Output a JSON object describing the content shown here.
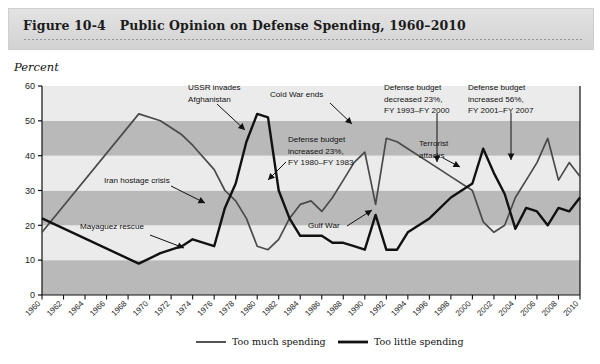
{
  "figure": {
    "number_label": "Figure 10-4",
    "title": "Public Opinion on Defense Spending, 1960–2010"
  },
  "axis": {
    "y_title": "Percent"
  },
  "colors": {
    "band_light": "#ebebeb",
    "band_dark": "#b9b9b9",
    "too_much_line": "#4a4a4a",
    "too_little_line": "#111111",
    "header_bg": "#dcdcdc",
    "axis": "#111111"
  },
  "legend": {
    "items": [
      {
        "label": "Too much spending",
        "key": "too_much"
      },
      {
        "label": "Too little spending",
        "key": "too_little"
      }
    ]
  },
  "annotations": [
    {
      "name": "mayaguez-rescue",
      "text": "Mayaguez rescue",
      "lines": [
        "Mayaguez rescue"
      ],
      "x": 80,
      "y": 229
    },
    {
      "name": "iran-hostage-crisis",
      "text": "Iran hostage crisis",
      "lines": [
        "Iran hostage crisis"
      ],
      "x": 104,
      "y": 183
    },
    {
      "name": "ussr-invades-afghanistan",
      "text": "USSR invades Afghanistan",
      "lines": [
        "USSR invades",
        "Afghanistan"
      ],
      "x": 188,
      "y": 90
    },
    {
      "name": "cold-war-ends",
      "text": "Cold War ends",
      "lines": [
        "Cold War ends"
      ],
      "x": 270,
      "y": 97
    },
    {
      "name": "defense-budget-increased-23",
      "text": "Defense budget increased 23%, FY 1980–FY 1983",
      "lines": [
        "Defense budget",
        "increased 23%,",
        "FY 1980–FY 1983"
      ],
      "x": 288,
      "y": 142
    },
    {
      "name": "gulf-war",
      "text": "Gulf War",
      "lines": [
        "Gulf War"
      ],
      "x": 308,
      "y": 228
    },
    {
      "name": "defense-budget-decreased-23",
      "text": "Defense budget decreased 23%, FY 1993–FY 2000",
      "lines": [
        "Defense budget",
        "decreased 23%,",
        "FY 1993–FY 2000"
      ],
      "x": 384,
      "y": 90
    },
    {
      "name": "terrorist-attacks",
      "text": "Terrorist attacks",
      "lines": [
        "Terrorist",
        "attacks"
      ],
      "x": 419,
      "y": 146
    },
    {
      "name": "defense-budget-increased-56",
      "text": "Defense budget increased 56%, FY 2001–FY 2007",
      "lines": [
        "Defense budget",
        "increased 56%,",
        "FY 2001–FY 2007"
      ],
      "x": 468,
      "y": 90
    }
  ],
  "chart_data": {
    "type": "line",
    "title": "Public Opinion on Defense Spending, 1960–2010",
    "xlabel": "",
    "ylabel": "Percent",
    "ylim": [
      0,
      60
    ],
    "xlim": [
      1960,
      2010
    ],
    "yticks": [
      0,
      10,
      20,
      30,
      40,
      50,
      60
    ],
    "grid": "horizontal-banded",
    "legend_position": "bottom",
    "categories": [
      1960,
      1962,
      1964,
      1966,
      1968,
      1970,
      1972,
      1974,
      1976,
      1978,
      1980,
      1982,
      1984,
      1986,
      1988,
      1990,
      1992,
      1994,
      1996,
      1998,
      2000,
      2002,
      2004,
      2006,
      2008,
      2010
    ],
    "series": [
      {
        "name": "Too much spending",
        "x": [
          1960,
          1969,
          1971,
          1973,
          1974,
          1976,
          1977,
          1978,
          1979,
          1980,
          1981,
          1982,
          1983,
          1984,
          1985,
          1986,
          1987,
          1988,
          1989,
          1990,
          1991,
          1992,
          1993,
          1994,
          1996,
          1998,
          2000,
          2001,
          2002,
          2003,
          2004,
          2005,
          2006,
          2007,
          2008,
          2009,
          2010
        ],
        "values": [
          18,
          52,
          50,
          46,
          43,
          36,
          30,
          27,
          22,
          14,
          13,
          16,
          22,
          26,
          27,
          24,
          28,
          33,
          38,
          41,
          26,
          45,
          44,
          42,
          38,
          34,
          30,
          21,
          18,
          20,
          28,
          33,
          38,
          45,
          33,
          38,
          34
        ]
      },
      {
        "name": "Too little spending",
        "x": [
          1960,
          1969,
          1971,
          1973,
          1974,
          1976,
          1977,
          1978,
          1979,
          1980,
          1981,
          1982,
          1983,
          1984,
          1985,
          1986,
          1987,
          1988,
          1989,
          1990,
          1991,
          1992,
          1993,
          1994,
          1996,
          1998,
          2000,
          2001,
          2002,
          2003,
          2004,
          2005,
          2006,
          2007,
          2008,
          2009,
          2010
        ],
        "values": [
          22,
          9,
          12,
          14,
          16,
          14,
          25,
          32,
          44,
          52,
          51,
          30,
          22,
          17,
          17,
          17,
          15,
          15,
          14,
          13,
          23,
          13,
          13,
          18,
          22,
          28,
          32,
          42,
          35,
          29,
          19,
          25,
          24,
          20,
          25,
          24,
          28
        ]
      }
    ]
  }
}
